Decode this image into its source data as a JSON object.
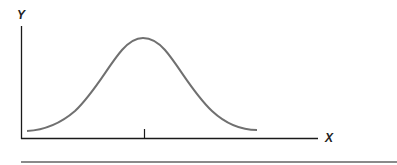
{
  "figure": {
    "y_axis_label": "Y",
    "x_axis_label": "X",
    "curve_color": "#707070",
    "axis_color": "#1a1a1a",
    "rule_color": "#8a8a8a",
    "tick": "center tick at mean"
  }
}
